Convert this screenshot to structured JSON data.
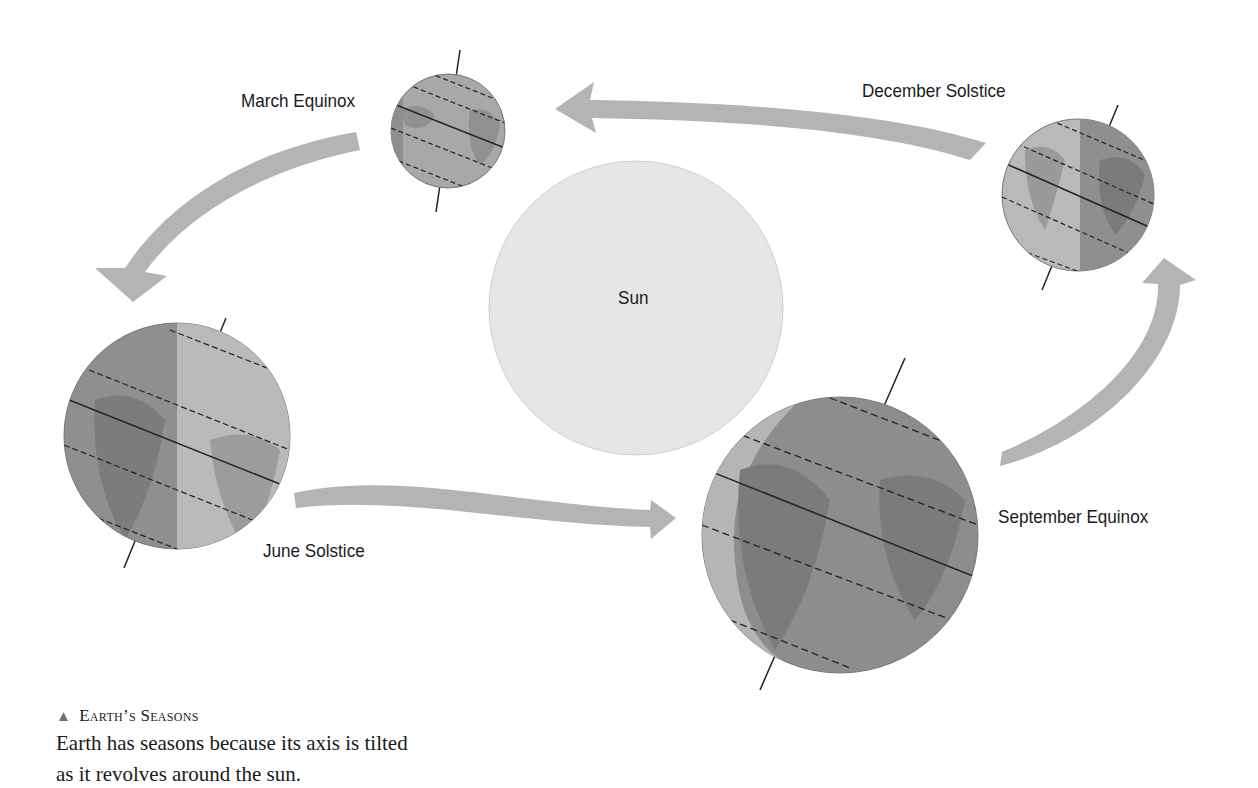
{
  "diagram": {
    "sun": {
      "label": "Sun",
      "color": "#e6e6e6"
    },
    "earths": [
      {
        "id": "march-equinox",
        "label": "March Equinox"
      },
      {
        "id": "june-solstice",
        "label": "June Solstice"
      },
      {
        "id": "september-equinox",
        "label": "September Equinox"
      },
      {
        "id": "december-solstice",
        "label": "December Solstice"
      }
    ],
    "colors": {
      "arrow": "#b4b4b4",
      "earth_dark": "#8c8c8c",
      "earth_light": "#b9b9b9",
      "land": "#7a7a7a",
      "line": "#222222"
    }
  },
  "caption": {
    "marker": "▲",
    "title": "Earth’s Seasons",
    "text": "Earth has seasons because its axis is tilted as it revolves around the sun."
  }
}
